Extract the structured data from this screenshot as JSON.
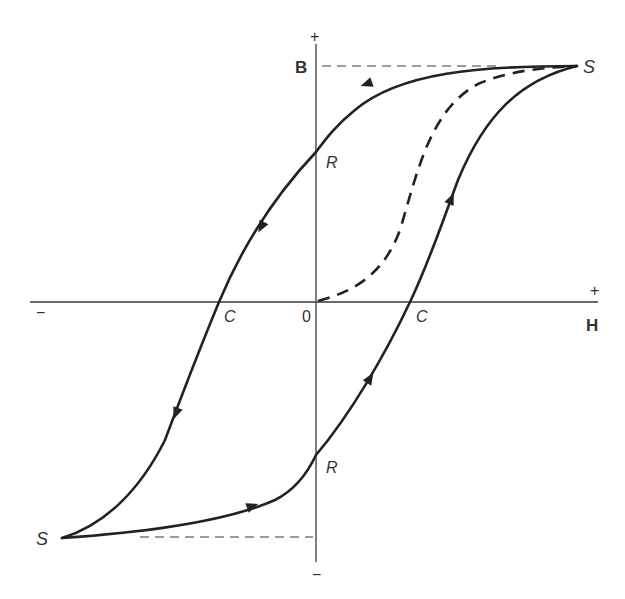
{
  "diagram": {
    "axes": {
      "vertical": {
        "label": "B",
        "positive_sign": "+",
        "negative_sign": "−"
      },
      "horizontal": {
        "label": "H",
        "positive_sign": "+",
        "negative_sign": "−"
      },
      "origin_label": "0"
    },
    "points": {
      "saturation_top": "S",
      "saturation_bottom": "S",
      "remanence_top": "R",
      "remanence_bottom": "R",
      "coercivity_left": "C",
      "coercivity_right": "C"
    },
    "curves": [
      {
        "name": "initial-magnetization",
        "style": "dashed",
        "from": "0",
        "to": "S (top)"
      },
      {
        "name": "descending-branch",
        "style": "solid",
        "from": "S (top)",
        "through": [
          "R (top)",
          "C (left)"
        ],
        "to": "S (bottom)",
        "arrows": 3
      },
      {
        "name": "ascending-branch",
        "style": "solid",
        "from": "S (bottom)",
        "through": [
          "R (bottom)",
          "C (right)"
        ],
        "to": "S (top)",
        "arrows": 3
      }
    ],
    "colors": {
      "line": "#222222",
      "axis": "#3a3a3a",
      "background": "#ffffff"
    }
  }
}
